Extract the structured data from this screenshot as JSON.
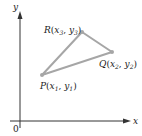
{
  "axes": {
    "x_label": "x",
    "y_label": "y",
    "origin_label": "0",
    "color": "#333333"
  },
  "triangle": {
    "stroke_color": "#a6a6a6",
    "vertices": [
      {
        "name": "P",
        "x_sub": "1",
        "y_sub": "1",
        "label": "P(x1, y1)"
      },
      {
        "name": "Q",
        "x_sub": "2",
        "y_sub": "2",
        "label": "Q(x2, y2)"
      },
      {
        "name": "R",
        "x_sub": "3",
        "y_sub": "3",
        "label": "R(x3, y3)"
      }
    ]
  }
}
